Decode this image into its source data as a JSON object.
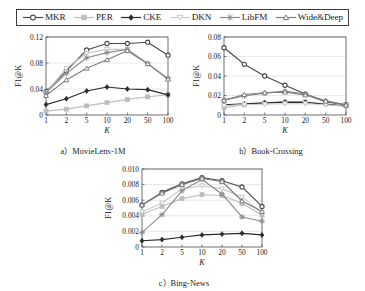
{
  "legend": {
    "position": "top",
    "entries": [
      {
        "label": "MKR",
        "marker": "circle",
        "color": "#4a4a4a"
      },
      {
        "label": "PER",
        "marker": "square",
        "color": "#bdbdbd"
      },
      {
        "label": "CKE",
        "marker": "diamond",
        "color": "#2b2b2b"
      },
      {
        "label": "DKN",
        "marker": "triangle-down",
        "color": "#c9c9c9"
      },
      {
        "label": "LibFM",
        "marker": "star",
        "color": "#8c8c8c"
      },
      {
        "label": "Wide&Deep",
        "marker": "triangle-up",
        "color": "#7d7d7d"
      }
    ]
  },
  "chart_data": [
    {
      "id": "a",
      "type": "line",
      "title": "a）MovieLens-1M",
      "caption": "a）MovieLens-1M",
      "xlabel": "K",
      "ylabel": "F1@K",
      "categories": [
        "1",
        "2",
        "5",
        "10",
        "20",
        "50",
        "100"
      ],
      "x_scale": "categorical",
      "ylim": [
        0,
        0.12
      ],
      "yticks": [
        0,
        0.04,
        0.08,
        0.12
      ],
      "ytick_labels": [
        "0",
        "0.04",
        "0.08",
        "0.12"
      ],
      "grid": true,
      "series": [
        {
          "name": "MKR",
          "marker": "circle",
          "color": "#4a4a4a",
          "values": [
            0.036,
            0.068,
            0.1,
            0.11,
            0.11,
            0.112,
            0.092
          ]
        },
        {
          "name": "PER",
          "marker": "square",
          "color": "#bdbdbd",
          "values": [
            0.006,
            0.009,
            0.014,
            0.019,
            0.024,
            0.028,
            0.031
          ]
        },
        {
          "name": "CKE",
          "marker": "diamond",
          "color": "#2b2b2b",
          "values": [
            0.016,
            0.025,
            0.037,
            0.043,
            0.04,
            0.039,
            0.031
          ]
        },
        {
          "name": "DKN",
          "marker": "triangle-down",
          "color": "#c9c9c9",
          "values": [
            0.034,
            0.072,
            0.095,
            0.101,
            0.101,
            0.079,
            0.056
          ]
        },
        {
          "name": "LibFM",
          "marker": "star",
          "color": "#8c8c8c",
          "values": [
            0.034,
            0.064,
            0.088,
            0.096,
            0.101,
            0.079,
            0.056
          ]
        },
        {
          "name": "Wide&Deep",
          "marker": "triangle-up",
          "color": "#7d7d7d",
          "values": [
            0.03,
            0.054,
            0.072,
            0.085,
            0.099,
            0.079,
            0.055
          ]
        }
      ]
    },
    {
      "id": "b",
      "type": "line",
      "title": "b）Book-Crossing",
      "caption": "b）Book-Crossing",
      "xlabel": "K",
      "ylabel": "F1@K",
      "categories": [
        "1",
        "2",
        "5",
        "10",
        "20",
        "50",
        "100"
      ],
      "x_scale": "categorical",
      "ylim": [
        0,
        0.08
      ],
      "yticks": [
        0,
        0.02,
        0.04,
        0.06,
        0.08
      ],
      "ytick_labels": [
        "0",
        "0.02",
        "0.04",
        "0.06",
        "0.08"
      ],
      "grid": true,
      "series": [
        {
          "name": "MKR",
          "marker": "circle",
          "color": "#4a4a4a",
          "values": [
            0.069,
            0.052,
            0.04,
            0.0305,
            0.0215,
            0.0135,
            0.0105
          ]
        },
        {
          "name": "PER",
          "marker": "square",
          "color": "#bdbdbd",
          "values": [
            0.0075,
            0.0105,
            0.0125,
            0.0135,
            0.0135,
            0.0115,
            0.0095
          ]
        },
        {
          "name": "CKE",
          "marker": "diamond",
          "color": "#2b2b2b",
          "values": [
            0.0105,
            0.0115,
            0.0125,
            0.0132,
            0.013,
            0.011,
            0.0092
          ]
        },
        {
          "name": "DKN",
          "marker": "triangle-down",
          "color": "#c9c9c9",
          "values": [
            0.0095,
            0.0105,
            0.011,
            0.0115,
            0.0115,
            0.0105,
            0.009
          ]
        },
        {
          "name": "LibFM",
          "marker": "star",
          "color": "#8c8c8c",
          "values": [
            0.0155,
            0.0195,
            0.0225,
            0.0245,
            0.0215,
            0.0145,
            0.0105
          ]
        },
        {
          "name": "Wide&Deep",
          "marker": "triangle-up",
          "color": "#7d7d7d",
          "values": [
            0.015,
            0.021,
            0.0228,
            0.0235,
            0.0205,
            0.0142,
            0.0102
          ]
        }
      ]
    },
    {
      "id": "c",
      "type": "line",
      "title": "c）Bing-News",
      "caption": "c）Bing-News",
      "xlabel": "K",
      "ylabel": "F1@K",
      "categories": [
        "1",
        "2",
        "5",
        "10",
        "20",
        "50",
        "100"
      ],
      "x_scale": "categorical",
      "ylim": [
        0,
        0.01
      ],
      "yticks": [
        0,
        0.002,
        0.004,
        0.006,
        0.008,
        0.01
      ],
      "ytick_labels": [
        "0",
        "0.002",
        "0.004",
        "0.006",
        "0.008",
        "0.010"
      ],
      "grid": true,
      "series": [
        {
          "name": "MKR",
          "marker": "circle",
          "color": "#4a4a4a",
          "values": [
            0.0054,
            0.007,
            0.0081,
            0.0089,
            0.0085,
            0.0077,
            0.0052
          ]
        },
        {
          "name": "PER",
          "marker": "square",
          "color": "#bdbdbd",
          "values": [
            0.0042,
            0.0052,
            0.0062,
            0.0067,
            0.0066,
            0.0056,
            0.0041
          ]
        },
        {
          "name": "CKE",
          "marker": "diamond",
          "color": "#2b2b2b",
          "values": [
            0.0008,
            0.00095,
            0.00125,
            0.00155,
            0.00165,
            0.00175,
            0.00155
          ]
        },
        {
          "name": "DKN",
          "marker": "triangle-down",
          "color": "#c9c9c9",
          "values": [
            0.0045,
            0.00565,
            0.00745,
            0.00785,
            0.00745,
            0.0064,
            0.0044
          ]
        },
        {
          "name": "LibFM",
          "marker": "star",
          "color": "#8c8c8c",
          "values": [
            0.00185,
            0.00415,
            0.0072,
            0.00865,
            0.0068,
            0.00385,
            0.0033
          ]
        },
        {
          "name": "Wide&Deep",
          "marker": "triangle-up",
          "color": "#7d7d7d",
          "values": [
            0.0054,
            0.0069,
            0.008,
            0.0088,
            0.0084,
            0.0059,
            0.00455
          ]
        }
      ]
    }
  ]
}
